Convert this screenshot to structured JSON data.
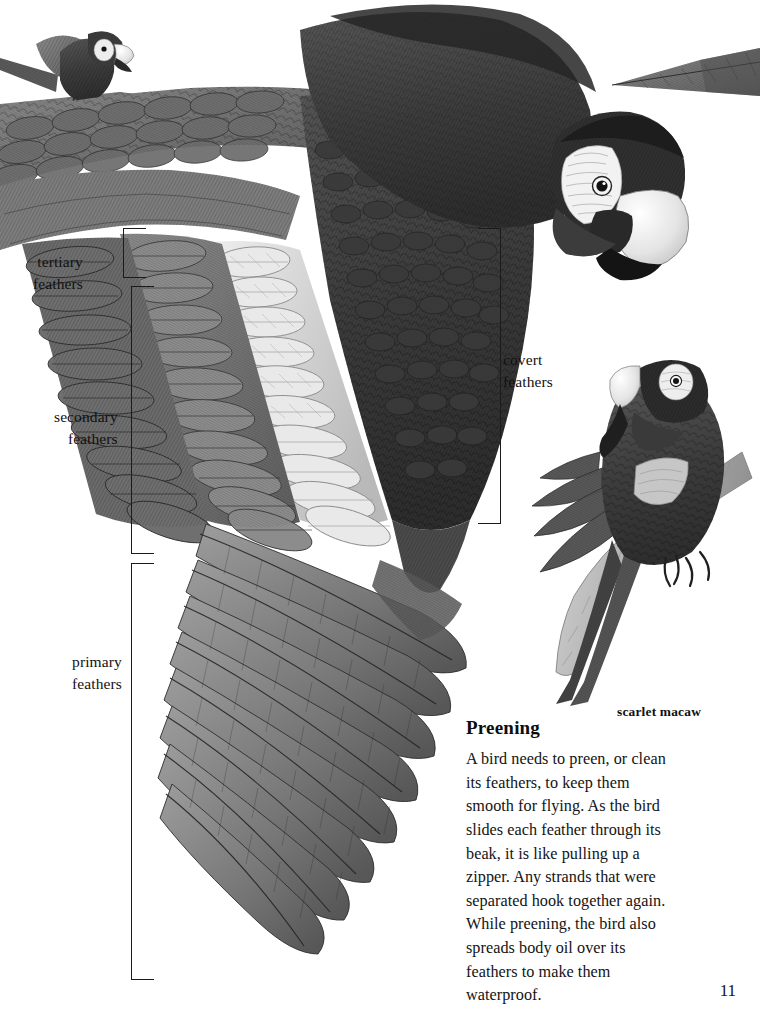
{
  "page": {
    "number": "11",
    "background_color": "#ffffff",
    "ink_color": "#1a1a1a",
    "width": 760,
    "height": 1013
  },
  "illustration": {
    "subject": "scarlet macaw wing anatomy",
    "style": "grayscale engraved pencil illustration",
    "palette": {
      "darkest": "#2b2b2b",
      "dark": "#4a4a4a",
      "mid": "#6e6e6e",
      "light": "#a8a8a8",
      "lightest": "#dcdcdc",
      "paper": "#ffffff",
      "beak_light": "#efefef"
    },
    "elements": [
      {
        "name": "perched-macaw-top-left",
        "description": "small macaw perched on a branch, upper left corner"
      },
      {
        "name": "tail-feather-top-right",
        "description": "long tapering tail feather entering from the right edge"
      },
      {
        "name": "flying-macaw-main",
        "description": "large macaw in flight with outstretched wing, head at upper right"
      },
      {
        "name": "preening-macaw",
        "description": "macaw perched on a branch preening its breast feathers"
      },
      {
        "name": "branch",
        "description": "diagonal tree branch supporting the preening macaw"
      }
    ]
  },
  "callouts": [
    {
      "id": "tertiary",
      "line1": "tertiary",
      "line2": "feathers",
      "label_left": 33,
      "label_top": 251,
      "bracket": {
        "left": 123,
        "top": 228,
        "width": 22,
        "height": 48,
        "orientation": "open-right"
      }
    },
    {
      "id": "secondary",
      "line1": "secondary",
      "line2": "feathers",
      "label_left": 54,
      "label_top": 406,
      "bracket": {
        "left": 131,
        "top": 286,
        "width": 22,
        "height": 266,
        "orientation": "open-right"
      }
    },
    {
      "id": "primary",
      "line1": "primary",
      "line2": "feathers",
      "label_left": 72,
      "label_top": 651,
      "bracket": {
        "left": 131,
        "top": 563,
        "width": 22,
        "height": 415,
        "orientation": "open-right"
      }
    },
    {
      "id": "covert",
      "line1": "covert",
      "line2": "feathers",
      "label_left": 503,
      "label_top": 349,
      "bracket": {
        "left": 478,
        "top": 228,
        "width": 22,
        "height": 294,
        "orientation": "open-left"
      }
    }
  ],
  "species_caption": "scarlet macaw",
  "preening": {
    "heading": "Preening",
    "body": "A bird needs to preen, or clean its feathers, to keep them smooth for flying. As the bird slides each feather through its beak, it is like pulling up a zipper. Any strands that were separated hook together again. While preening, the bird also spreads body oil over its feathers to make them waterproof."
  }
}
